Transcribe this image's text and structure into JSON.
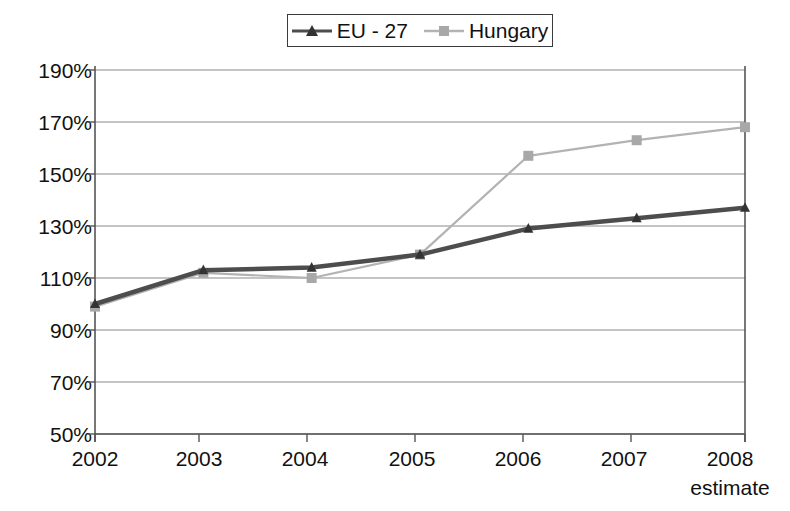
{
  "chart_data": {
    "type": "line",
    "title": "",
    "subtitle": "",
    "xlabel": "",
    "ylabel": "",
    "grid": true,
    "legend_position": "top-center",
    "categories": [
      "2002",
      "2003",
      "2004",
      "2005",
      "2006",
      "2007",
      "2008"
    ],
    "x_tick_sublabels": [
      "",
      "",
      "",
      "",
      "",
      "",
      "estimate"
    ],
    "ylim": [
      50,
      190
    ],
    "y_ticks": [
      50,
      70,
      90,
      110,
      130,
      150,
      170,
      190
    ],
    "y_tick_labels": [
      "50%",
      "70%",
      "90%",
      "110%",
      "130%",
      "150%",
      "170%",
      "190%"
    ],
    "value_suffix": "%",
    "series": [
      {
        "name": "EU - 27",
        "marker": "triangle",
        "color": "#4d4d4d",
        "values": [
          100,
          113,
          114,
          119,
          129,
          133,
          137
        ]
      },
      {
        "name": "Hungary",
        "marker": "square",
        "color": "#b3b3b3",
        "values": [
          99,
          112,
          110,
          119,
          157,
          163,
          168
        ]
      }
    ]
  },
  "legend": {
    "entries": [
      {
        "label": "EU - 27",
        "marker": "triangle-marker-icon",
        "color": "#4d4d4d"
      },
      {
        "label": "Hungary",
        "marker": "square-marker-icon",
        "color": "#b3b3b3"
      }
    ]
  },
  "axes": {
    "y_labels": [
      "190%",
      "170%",
      "150%",
      "130%",
      "110%",
      "90%",
      "70%",
      "50%"
    ],
    "x_labels": [
      "2002",
      "2003",
      "2004",
      "2005",
      "2006",
      "2007",
      "2008"
    ],
    "x_note": "estimate"
  },
  "colors": {
    "eu27": "#4d4d4d",
    "hungary": "#b3b3b3",
    "axis": "#555555",
    "grid": "#8a8a8a",
    "background": "#ffffff",
    "text": "#111111"
  }
}
